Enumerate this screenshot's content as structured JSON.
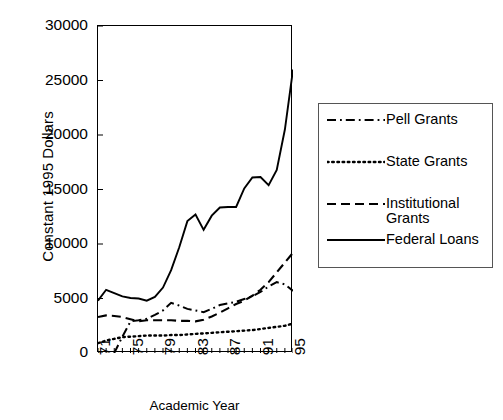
{
  "chart_data": {
    "type": "line",
    "title": "",
    "xlabel": "Academic Year",
    "ylabel": "Constant 1995 Dollars",
    "xlim": [
      71,
      95
    ],
    "ylim": [
      0,
      30000
    ],
    "grid": false,
    "legend_position": "right",
    "y_ticks": [
      30000,
      25000,
      20000,
      15000,
      10000,
      5000,
      0
    ],
    "y_tick_labels": [
      "30000",
      "25000",
      "20000",
      "15000",
      "10000",
      "5000",
      "0"
    ],
    "x_ticks": [
      71,
      75,
      79,
      83,
      87,
      91,
      95
    ],
    "x_tick_labels": [
      "71",
      "75",
      "79",
      "83",
      "87",
      "91",
      "95"
    ],
    "x_minor_ticks_every": 1,
    "x": [
      71,
      72,
      73,
      74,
      75,
      76,
      77,
      78,
      79,
      80,
      81,
      82,
      83,
      84,
      85,
      86,
      87,
      88,
      89,
      90,
      91,
      92,
      93,
      94,
      95
    ],
    "series": [
      {
        "name": "Pell Grants",
        "style": "dash-dot",
        "color": "#000000",
        "values": [
          null,
          null,
          0,
          1500,
          2900,
          3000,
          3150,
          3500,
          3900,
          4600,
          4350,
          4050,
          3900,
          3750,
          4050,
          4400,
          4550,
          4700,
          4950,
          5200,
          5600,
          6100,
          6500,
          6300,
          5700
        ]
      },
      {
        "name": "State Grants",
        "style": "dotted",
        "color": "#000000",
        "values": [
          900,
          1150,
          1300,
          1450,
          1500,
          1550,
          1600,
          1600,
          1600,
          1650,
          1650,
          1700,
          1750,
          1800,
          1850,
          1900,
          1950,
          2000,
          2050,
          2100,
          2200,
          2300,
          2400,
          2500,
          2700
        ]
      },
      {
        "name": "Institutional\nGrants",
        "style": "dashed",
        "color": "#000000",
        "values": [
          3300,
          3450,
          3400,
          3300,
          3100,
          2900,
          3000,
          3000,
          3000,
          3000,
          2950,
          2950,
          2900,
          3050,
          3350,
          3700,
          4100,
          4500,
          4800,
          5250,
          5800,
          6500,
          7400,
          8300,
          9200
        ]
      },
      {
        "name": "Federal Loans",
        "style": "solid",
        "color": "#000000",
        "values": [
          4800,
          5800,
          5500,
          5200,
          5050,
          5000,
          4800,
          5150,
          6000,
          7600,
          9700,
          12100,
          12700,
          11300,
          12600,
          13350,
          13400,
          13400,
          15100,
          16100,
          16150,
          15400,
          16800,
          20500,
          26000
        ]
      }
    ]
  },
  "legend": {
    "entries": [
      {
        "label": "Pell Grants",
        "style": "dash-dot"
      },
      {
        "label": "State Grants",
        "style": "dotted"
      },
      {
        "label": "Institutional\nGrants",
        "style": "dashed"
      },
      {
        "label": "Federal Loans",
        "style": "solid"
      }
    ]
  }
}
